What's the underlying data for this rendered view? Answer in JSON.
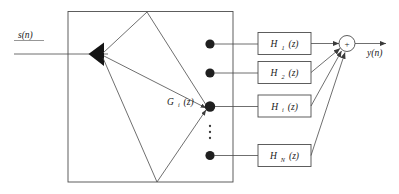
{
  "diagram": {
    "input": {
      "label": "s(n)",
      "name": "input-signal"
    },
    "output": {
      "label": "y(n)",
      "name": "output-signal"
    },
    "analysis_block": {
      "name": "analysis-filter-bank",
      "gain_label_base": "G",
      "gain_label_sub": "i",
      "gain_label_tail": "(z)",
      "gain_label_full": "Gi(z)"
    },
    "summer": {
      "name": "summing-junction",
      "operator": "+"
    },
    "filters": [
      {
        "base": "H",
        "sub": "1",
        "tail": "(z)",
        "full": "H1(z)"
      },
      {
        "base": "H",
        "sub": "2",
        "tail": "(z)",
        "full": "H2(z)"
      },
      {
        "base": "H",
        "sub": "i",
        "tail": "(z)",
        "full": "Hi(z)"
      },
      {
        "base": "H",
        "sub": "N",
        "tail": "(z)",
        "full": "HN(z)"
      }
    ],
    "ellipsis": "vertical-dots",
    "colors": {
      "background": "#ffffff",
      "line": "#4a4a4a",
      "box_border": "#4d4d4d",
      "node": "#1f1f1f",
      "text": "#1a1a1a"
    }
  }
}
